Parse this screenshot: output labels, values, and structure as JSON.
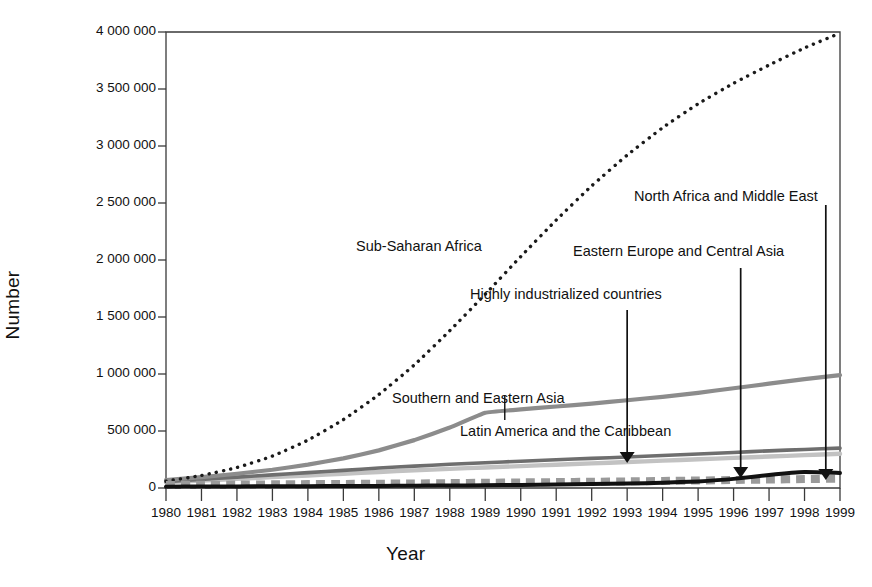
{
  "axes": {
    "ylabel": "Number",
    "xlabel": "Year",
    "y_ticks": [
      "0",
      "500 000",
      "1 000 000",
      "1 500 000",
      "2 000 000",
      "2 500 000",
      "3 000 000",
      "3 500 000",
      "4 000 000"
    ],
    "x_ticks": [
      "1980",
      "1981",
      "1982",
      "1983",
      "1984",
      "1985",
      "1986",
      "1987",
      "1988",
      "1989",
      "1990",
      "1991",
      "1992",
      "1993",
      "1994",
      "1995",
      "1996",
      "1997",
      "1998",
      "1999"
    ]
  },
  "annotations": {
    "sub_saharan_africa": "Sub-Saharan Africa",
    "north_africa_middle_east": "North Africa and Middle East",
    "eastern_europe_central_asia": "Eastern Europe and Central Asia",
    "highly_industrialized": "Highly industrialized countries",
    "southern_eastern_asia": "Southern and Eastern Asia",
    "latin_america_caribbean": "Latin America and the Caribbean"
  },
  "chart_data": {
    "type": "line",
    "title": "",
    "xlabel": "Year",
    "ylabel": "Number",
    "xlim": [
      1980,
      1999
    ],
    "ylim": [
      0,
      4000000
    ],
    "ytick_values": [
      0,
      500000,
      1000000,
      1500000,
      2000000,
      2500000,
      3000000,
      3500000,
      4000000
    ],
    "x": [
      1980,
      1981,
      1982,
      1983,
      1984,
      1985,
      1986,
      1987,
      1988,
      1989,
      1990,
      1991,
      1992,
      1993,
      1994,
      1995,
      1996,
      1997,
      1998,
      1999
    ],
    "grid": false,
    "legend": "inline-annotations",
    "series": [
      {
        "name": "Sub-Saharan Africa",
        "style": "dotted",
        "color": "#1a1a1a",
        "values": [
          60000,
          110000,
          180000,
          280000,
          420000,
          600000,
          820000,
          1080000,
          1380000,
          1700000,
          2030000,
          2350000,
          2650000,
          2920000,
          3160000,
          3370000,
          3550000,
          3710000,
          3860000,
          3990000
        ]
      },
      {
        "name": "Southern and Eastern Asia",
        "style": "solid",
        "color": "#8c8c8c",
        "values": [
          70000,
          95000,
          125000,
          160000,
          205000,
          260000,
          330000,
          420000,
          530000,
          660000,
          690000,
          715000,
          740000,
          770000,
          800000,
          835000,
          875000,
          915000,
          955000,
          990000
        ]
      },
      {
        "name": "Latin America and the Caribbean",
        "style": "solid",
        "color": "#6e6e6e",
        "values": [
          55000,
          75000,
          95000,
          115000,
          135000,
          155000,
          175000,
          192000,
          208000,
          222000,
          235000,
          248000,
          260000,
          272000,
          285000,
          298000,
          312000,
          326000,
          338000,
          350000
        ]
      },
      {
        "name": "Highly industrialized countries",
        "style": "solid",
        "color": "#c2c2c2",
        "values": [
          50000,
          65000,
          80000,
          95000,
          110000,
          125000,
          140000,
          155000,
          168000,
          180000,
          192000,
          204000,
          216000,
          228000,
          240000,
          252000,
          264000,
          276000,
          288000,
          300000
        ]
      },
      {
        "name": "Eastern Europe and Central Asia",
        "style": "solid",
        "color": "#111111",
        "values": [
          12000,
          13000,
          14000,
          15000,
          16000,
          17000,
          18000,
          20000,
          22000,
          24000,
          27000,
          30000,
          34000,
          39000,
          46000,
          58000,
          80000,
          115000,
          140000,
          132000
        ]
      },
      {
        "name": "North Africa and Middle East",
        "style": "dashed",
        "color": "#9a9a9a",
        "values": [
          26000,
          28000,
          30000,
          32000,
          34000,
          36000,
          38000,
          40000,
          43000,
          46000,
          49000,
          52000,
          55000,
          58000,
          62000,
          66000,
          70000,
          74000,
          78000,
          82000
        ]
      }
    ]
  }
}
